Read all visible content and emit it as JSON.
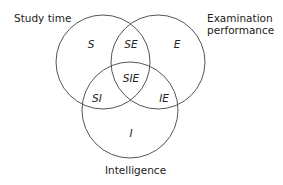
{
  "diagram": {
    "type": "venn",
    "sets": [
      {
        "id": "S",
        "label": "Study time"
      },
      {
        "id": "E",
        "label_line1": "Examination",
        "label_line2": "performance"
      },
      {
        "id": "I",
        "label": "Intelligence"
      }
    ],
    "regions": {
      "S": "S",
      "SE": "SE",
      "E": "E",
      "SIE": "SIE",
      "SI": "SI",
      "IE": "IE",
      "I": "I"
    },
    "stroke_color": "#555555"
  }
}
